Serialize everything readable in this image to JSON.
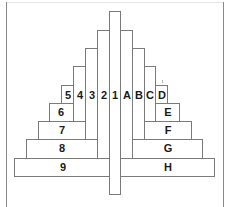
{
  "diagram": {
    "center_column": {
      "label": "1",
      "x": 109,
      "y": 11,
      "w": 12,
      "h": 183
    },
    "vertical_columns_left": [
      {
        "label": "2",
        "x": 97,
        "y": 30,
        "w": 12
      },
      {
        "label": "3",
        "x": 85,
        "y": 48,
        "w": 12
      },
      {
        "label": "4",
        "x": 73,
        "y": 66,
        "w": 12
      },
      {
        "label": "5",
        "x": 61,
        "y": 85,
        "w": 12
      }
    ],
    "vertical_columns_right": [
      {
        "label": "A",
        "x": 121,
        "y": 30,
        "w": 12
      },
      {
        "label": "B",
        "x": 133,
        "y": 48,
        "w": 12
      },
      {
        "label": "C",
        "x": 145,
        "y": 66,
        "w": 11
      },
      {
        "label": "D",
        "x": 156,
        "y": 85,
        "w": 12
      }
    ],
    "horizontal_rows_left": [
      {
        "label": "6",
        "x": 49,
        "y": 103,
        "w": 24,
        "h": 19
      },
      {
        "label": "7",
        "x": 38,
        "y": 121,
        "w": 47,
        "h": 19
      },
      {
        "label": "8",
        "x": 26,
        "y": 139,
        "w": 71,
        "h": 19
      },
      {
        "label": "9",
        "x": 14,
        "y": 158,
        "w": 95,
        "h": 19
      }
    ],
    "horizontal_rows_right": [
      {
        "label": "E",
        "x": 156,
        "y": 103,
        "w": 24,
        "h": 19
      },
      {
        "label": "F",
        "x": 145,
        "y": 121,
        "w": 47,
        "h": 19
      },
      {
        "label": "G",
        "x": 133,
        "y": 139,
        "w": 70,
        "h": 19
      },
      {
        "label": "H",
        "x": 121,
        "y": 158,
        "w": 94,
        "h": 19
      }
    ],
    "top_labels": [
      "5",
      "4",
      "3",
      "2",
      "1",
      "A",
      "B",
      "C",
      "D"
    ],
    "stroke_color": "#7a7a7a",
    "text_color": "#1a1a1a"
  }
}
